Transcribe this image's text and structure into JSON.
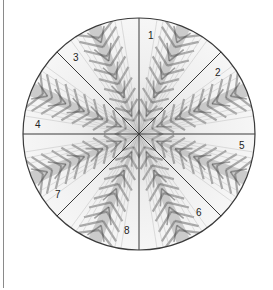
{
  "figure": {
    "type": "segmented-circle",
    "center": [
      139,
      134
    ],
    "radius": 116,
    "sector_count": 8,
    "colors": {
      "outline": "#3a3a3a",
      "spoke": "#3a3a3a",
      "texture_dark": "#5a5a5a",
      "texture_light": "#f4f4f4",
      "left_rule": "#8a8a8a"
    },
    "sectors": [
      {
        "label": "1",
        "x": 148,
        "y": 39
      },
      {
        "label": "2",
        "x": 218,
        "y": 76
      },
      {
        "label": "3",
        "x": 76,
        "y": 61
      },
      {
        "label": "4",
        "x": 38,
        "y": 128
      },
      {
        "label": "5",
        "x": 242,
        "y": 149
      },
      {
        "label": "6",
        "x": 199,
        "y": 216
      },
      {
        "label": "7",
        "x": 58,
        "y": 198
      },
      {
        "label": "8",
        "x": 127,
        "y": 234
      }
    ]
  }
}
